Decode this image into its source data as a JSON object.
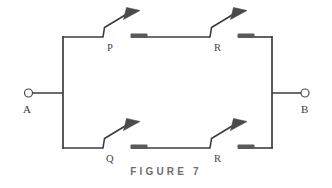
{
  "figure": {
    "caption": "F I G U R E   7",
    "caption_plain": "FIGURE 7",
    "type": "relay-contact-ladder-network",
    "line_color": "#3c3c3c",
    "contact_bar_color": "#5a5a5a",
    "terminal_color": "#4a4a4a",
    "label_color": "#454545",
    "caption_color": "#6e6e6e",
    "background": "#ffffff"
  },
  "terminals": [
    {
      "id": "A",
      "label": "A",
      "side": "left",
      "x": 28,
      "y": 93,
      "label_x": 23,
      "label_y": 103
    },
    {
      "id": "B",
      "label": "B",
      "side": "right",
      "x": 305,
      "y": 93,
      "label_x": 302,
      "label_y": 103
    }
  ],
  "branches": [
    {
      "id": "top-branch",
      "name": "upper-parallel-path",
      "contacts": [
        {
          "id": "contact-P",
          "label": "P",
          "state": "normally-open",
          "label_x": 108,
          "label_y": 47
        },
        {
          "id": "contact-R-top",
          "label": "R",
          "state": "normally-open",
          "label_x": 215,
          "label_y": 47
        }
      ]
    },
    {
      "id": "bottom-branch",
      "name": "lower-parallel-path",
      "contacts": [
        {
          "id": "contact-Q",
          "label": "Q",
          "state": "normally-open",
          "label_x": 108,
          "label_y": 160
        },
        {
          "id": "contact-R-bottom",
          "label": "R",
          "state": "normally-open",
          "label_x": 215,
          "label_y": 160
        }
      ]
    }
  ],
  "geometry": {
    "left_bus_x": 63,
    "right_bus_x": 272,
    "top_rail_y": 37,
    "bottom_rail_y": 148,
    "mid_y": 93
  }
}
